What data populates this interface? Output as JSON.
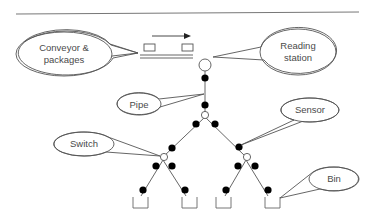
{
  "diagram": {
    "type": "package sorting tree",
    "labels": {
      "conveyor_line1": "Conveyor &",
      "conveyor_line2": "packages",
      "reading_line1": "Reading",
      "reading_line2": "station",
      "pipe": "Pipe",
      "sensor": "Sensor",
      "switch": "Switch",
      "bin": "Bin"
    },
    "colors": {
      "line": "#555555",
      "node_fill": "#000000",
      "switch_fill": "#ffffff",
      "text": "#4a4a4a"
    },
    "counts": {
      "switches": 3,
      "sensors": 14,
      "bins": 4
    }
  }
}
